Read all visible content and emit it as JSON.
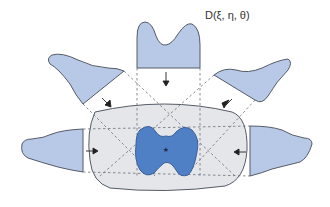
{
  "diagram": {
    "title_label": "D(ξ, η, θ)",
    "colors": {
      "projection_fill": "#b8c9e8",
      "object_fill": "#4f7fc4",
      "body_fill": "#e4e6ea",
      "outline": "#555b66",
      "dash": "#6b6f78",
      "arrow": "#222222",
      "center_marker": "#1b2a4a"
    },
    "elements": {
      "projections": [
        {
          "id": "top",
          "label": "top projection"
        },
        {
          "id": "upper-left",
          "label": "upper-left projection"
        },
        {
          "id": "upper-right",
          "label": "upper-right projection"
        },
        {
          "id": "left",
          "label": "left projection"
        },
        {
          "id": "right",
          "label": "right projection"
        }
      ],
      "central_body": "cross-section body",
      "object": "reconstructed object",
      "center_marker": "★"
    }
  }
}
